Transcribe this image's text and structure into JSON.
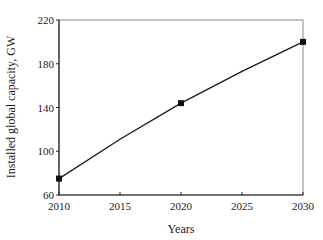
{
  "chart_data": {
    "type": "line",
    "title": "",
    "xlabel": "Years",
    "ylabel": "Installed global capacity, GW",
    "x": [
      2010,
      2015,
      2020,
      2025,
      2030
    ],
    "series": [
      {
        "name": "Installed global capacity",
        "marker_x": [
          2010,
          2020,
          2030
        ],
        "marker_values": [
          75,
          144,
          200
        ],
        "line_x": [
          2010,
          2015,
          2020,
          2025,
          2030
        ],
        "line_values": [
          75,
          111,
          144,
          173,
          200
        ]
      }
    ],
    "xlim": [
      2010,
      2030
    ],
    "ylim": [
      60,
      220
    ],
    "xticks": [
      "2010",
      "2015",
      "2020",
      "2025",
      "2030"
    ],
    "yticks": [
      "60",
      "100",
      "140",
      "180",
      "220"
    ],
    "grid": false,
    "legend": null
  },
  "colors": {
    "line": "#1a1a1a",
    "frame": "#555555",
    "marker": "#111111"
  }
}
